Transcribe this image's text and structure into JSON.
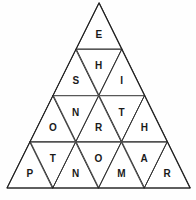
{
  "puzzle": {
    "title": "Letter Triangle Puzzle",
    "shape": "equilateral-triangle",
    "row_count": 4,
    "cell_count": 16,
    "colors": {
      "background": "#fefefe",
      "cell_fill": "#ffffff",
      "edge_stroke": "#2b2b2b",
      "outer_edge_stroke": "#1f1f1f",
      "row_divider_stroke": "#585858",
      "letter_color": "#1a1a1a"
    },
    "geometry": {
      "apex_x": 99,
      "apex_y": 3,
      "base_left_x": 7,
      "base_right_x": 190,
      "base_y": 188,
      "row_divider_y": [
        44,
        92,
        141
      ]
    },
    "rows": [
      {
        "index": 1,
        "cells": [
          {
            "letter": "E",
            "orientation": "up",
            "position": 1
          }
        ]
      },
      {
        "index": 2,
        "cells": [
          {
            "letter": "S",
            "orientation": "up",
            "position": 1
          },
          {
            "letter": "H",
            "orientation": "down",
            "position": 2
          },
          {
            "letter": "I",
            "orientation": "up",
            "position": 3
          }
        ]
      },
      {
        "index": 3,
        "cells": [
          {
            "letter": "O",
            "orientation": "up",
            "position": 1
          },
          {
            "letter": "N",
            "orientation": "down",
            "position": 2
          },
          {
            "letter": "R",
            "orientation": "up",
            "position": 3
          },
          {
            "letter": "T",
            "orientation": "down",
            "position": 4
          },
          {
            "letter": "H",
            "orientation": "up",
            "position": 5
          }
        ]
      },
      {
        "index": 4,
        "cells": [
          {
            "letter": "P",
            "orientation": "up",
            "position": 1
          },
          {
            "letter": "T",
            "orientation": "down",
            "position": 2
          },
          {
            "letter": "N",
            "orientation": "up",
            "position": 3
          },
          {
            "letter": "O",
            "orientation": "down",
            "position": 4
          },
          {
            "letter": "M",
            "orientation": "up",
            "position": 5
          },
          {
            "letter": "A",
            "orientation": "down",
            "position": 6
          },
          {
            "letter": "R",
            "orientation": "up",
            "position": 7
          }
        ]
      }
    ]
  }
}
